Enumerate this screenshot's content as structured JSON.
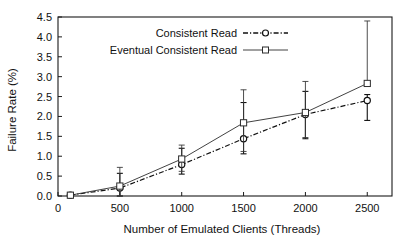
{
  "chart_data": {
    "type": "line",
    "title": "",
    "xlabel": "Number of Emulated Clients (Threads)",
    "ylabel": "Failure Rate (%)",
    "xlim": [
      0,
      2700
    ],
    "ylim": [
      0.0,
      4.5
    ],
    "grid": false,
    "legend_position": "top-center",
    "x": [
      100,
      500,
      1000,
      1500,
      2000,
      2500
    ],
    "xticks": [
      "0",
      "500",
      "1000",
      "1500",
      "2000",
      "2500"
    ],
    "xtick_values": [
      0,
      500,
      1000,
      1500,
      2000,
      2500
    ],
    "yticks": [
      "0.0",
      "0.5",
      "1.0",
      "1.5",
      "2.0",
      "2.5",
      "3.0",
      "3.5",
      "4.0",
      "4.5"
    ],
    "ytick_values": [
      0.0,
      0.5,
      1.0,
      1.5,
      2.0,
      2.5,
      3.0,
      3.5,
      4.0,
      4.5
    ],
    "series": [
      {
        "name": "Consistent Read",
        "marker": "circle",
        "linestyle": "dash-dot",
        "values": [
          0.02,
          0.2,
          0.79,
          1.44,
          2.05,
          2.4
        ],
        "err_low": [
          0.02,
          0.0,
          0.55,
          1.06,
          1.44,
          1.9
        ],
        "err_high": [
          0.02,
          0.57,
          1.2,
          2.35,
          2.63,
          2.55
        ]
      },
      {
        "name": "Eventual Consistent Read",
        "marker": "square",
        "linestyle": "solid",
        "values": [
          0.02,
          0.25,
          0.93,
          1.84,
          2.1,
          2.83
        ],
        "err_low": [
          0.02,
          0.0,
          0.62,
          1.12,
          1.47,
          2.83
        ],
        "err_high": [
          0.02,
          0.72,
          1.28,
          2.67,
          2.88,
          4.4
        ]
      }
    ],
    "legend": [
      {
        "label": "Consistent Read",
        "marker": "circle",
        "linestyle": "dash-dot"
      },
      {
        "label": "Eventual Consistent Read",
        "marker": "square",
        "linestyle": "solid"
      }
    ]
  }
}
